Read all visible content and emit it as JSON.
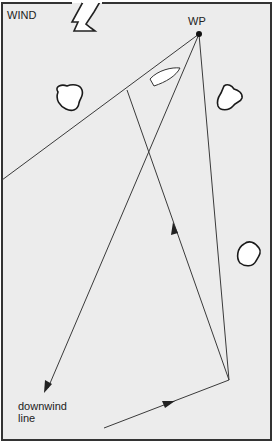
{
  "labels": {
    "wind": "WIND",
    "waypoint": "WP",
    "downwind_line": "downwind\nline",
    "downwind_line_1": "downwind",
    "downwind_line_2": "line"
  },
  "colors": {
    "background": "#ececec",
    "frame": "#333333",
    "line": "#3a3a3a",
    "island_fill": "#ffffff",
    "island_stroke": "#1a1a1a"
  },
  "elements": {
    "waypoint": {
      "x": 199,
      "y": 34
    },
    "tack_point": {
      "x": 127,
      "y": 90
    },
    "turn_point": {
      "x": 229,
      "y": 380
    },
    "downwind_arrow_tip": {
      "x": 46,
      "y": 392
    },
    "left_line_end": {
      "x": 2,
      "y": 180
    },
    "approach_start": {
      "x": 104,
      "y": 428
    },
    "islands": 3,
    "boat": 1
  }
}
